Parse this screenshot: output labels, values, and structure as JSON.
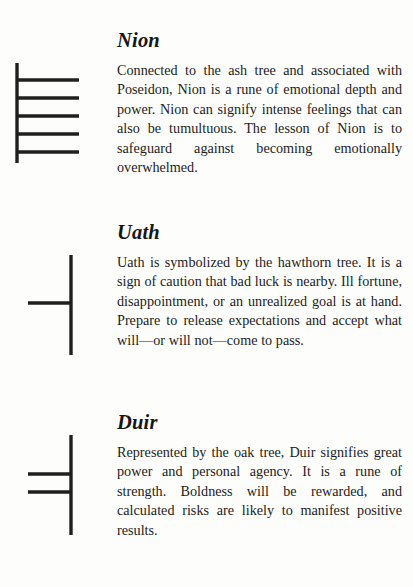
{
  "page": {
    "background_color": "#fdfdfb",
    "ink_color": "#1f1f1f",
    "entries": [
      {
        "id": "nion",
        "title": "Nion",
        "body": "Connected to the ash tree and associated with Poseidon, Nion is a rune of emotional depth and power. Nion can signify intense feelings that can also be tumultuous. The lesson of Nion is to safeguard against becoming emo­tionally overwhelmed.",
        "glyph": {
          "name": "nion-ogham-rune",
          "stem_side": "left",
          "branch_count": 5,
          "branch_direction": "right"
        }
      },
      {
        "id": "uath",
        "title": "Uath",
        "body": "Uath is symbolized by the hawthorn tree. It is a sign of caution that bad luck is nearby. Ill fortune, disappointment, or an unrealized goal is at hand. Prepare to release expecta­tions and accept what will—or will not—come to pass.",
        "glyph": {
          "name": "uath-ogham-rune",
          "stem_side": "right",
          "branch_count": 1,
          "branch_direction": "left"
        }
      },
      {
        "id": "duir",
        "title": "Duir",
        "body": "Represented by the oak tree, Duir signifies great power and personal agency. It is a rune of strength. Boldness will be rewarded, and calculated risks are likely to manifest positive results.",
        "glyph": {
          "name": "duir-ogham-rune",
          "stem_side": "right",
          "branch_count": 2,
          "branch_direction": "left"
        }
      }
    ]
  }
}
